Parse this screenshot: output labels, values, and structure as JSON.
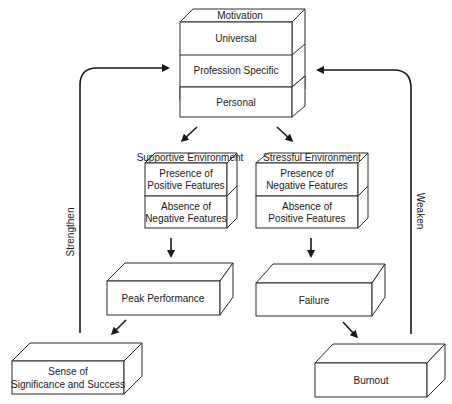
{
  "motivation": {
    "title": "Motivation",
    "layers": [
      "Universal",
      "Profession Specific",
      "Personal"
    ]
  },
  "supportive": {
    "title": "Supportive Environment",
    "layers": [
      [
        "Presence of",
        "Positive Features"
      ],
      [
        "Absence of",
        "Negative Features"
      ]
    ]
  },
  "stressful": {
    "title": "Stressful  Environment",
    "layers": [
      [
        "Presence of",
        "Negative Features"
      ],
      [
        "Absence of",
        "Positive Features"
      ]
    ]
  },
  "peak": {
    "label": "Peak Performance"
  },
  "failure": {
    "label": "Failure"
  },
  "sense": {
    "line1": "Sense of",
    "line2": "Significance and Success"
  },
  "burnout": {
    "label": "Burnout"
  },
  "feedback": {
    "left": "Strengthen",
    "right": "Weaken"
  },
  "colors": {
    "stroke": "#1a1a1a",
    "background": "#ffffff"
  }
}
